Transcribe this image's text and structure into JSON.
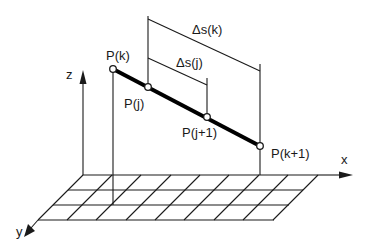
{
  "diagram": {
    "type": "3d-path-segment-arc-length",
    "colors": {
      "line": "#1a1a1a",
      "path": "#000000",
      "background": "#ffffff",
      "point_fill": "#ffffff"
    },
    "axes": {
      "x_label": "x",
      "y_label": "y",
      "z_label": "z"
    },
    "points": [
      {
        "id": "pk",
        "label": "P(k)"
      },
      {
        "id": "pj",
        "label": "P(j)"
      },
      {
        "id": "pj1",
        "label": "P(j+1)"
      },
      {
        "id": "pk1",
        "label": "P(k+1)"
      }
    ],
    "dimensions": [
      {
        "id": "ds_k",
        "label": "Δs(k)"
      },
      {
        "id": "ds_j",
        "label": "Δs(j)"
      }
    ],
    "ground_grid": {
      "rows": 3,
      "columns": 8
    }
  }
}
